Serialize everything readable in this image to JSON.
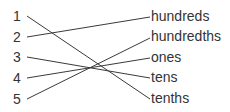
{
  "diagram": {
    "type": "matching",
    "left_items": [
      {
        "label": "1",
        "y": 16
      },
      {
        "label": "2",
        "y": 37
      },
      {
        "label": "3",
        "y": 57
      },
      {
        "label": "4",
        "y": 78
      },
      {
        "label": "5",
        "y": 99
      }
    ],
    "right_items": [
      {
        "label": "hundreds",
        "y": 17
      },
      {
        "label": "hundredths",
        "y": 37
      },
      {
        "label": "ones",
        "y": 58
      },
      {
        "label": "tens",
        "y": 78
      },
      {
        "label": "tenths",
        "y": 99
      }
    ],
    "connections": [
      {
        "from": "1",
        "to": "tenths"
      },
      {
        "from": "2",
        "to": "hundreds"
      },
      {
        "from": "3",
        "to": "tens"
      },
      {
        "from": "4",
        "to": "ones"
      },
      {
        "from": "5",
        "to": "hundredths"
      }
    ],
    "line_color": "#3a3a3a",
    "text_color": "#333333"
  }
}
